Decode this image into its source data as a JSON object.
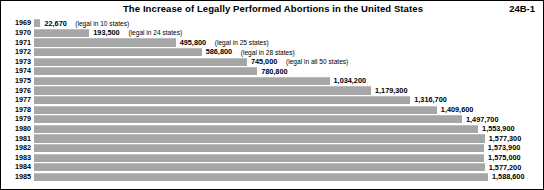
{
  "header": {
    "title": "The Increase of Legally Performed Abortions in the United States",
    "plate_code": "24B-1"
  },
  "chart_data": {
    "type": "bar",
    "orientation": "horizontal",
    "title": "The Increase of Legally Performed Abortions in the United States",
    "xlabel": "",
    "ylabel": "",
    "grid": false,
    "legend": "none",
    "xlim": [
      0,
      1588600
    ],
    "categories": [
      "1969",
      "1970",
      "1971",
      "1972",
      "1973",
      "1974",
      "1975",
      "1976",
      "1977",
      "1978",
      "1979",
      "1980",
      "1981",
      "1982",
      "1983",
      "1984",
      "1985"
    ],
    "values": [
      22670,
      193500,
      495800,
      586800,
      745000,
      780800,
      1034200,
      1179300,
      1316700,
      1409600,
      1497700,
      1553900,
      1577300,
      1573900,
      1575000,
      1577200,
      1588600
    ],
    "value_labels": [
      "22,670",
      "193,500",
      "495,800",
      "586,800",
      "745,000",
      "780,800",
      "1,034,200",
      "1,179,300",
      "1,316,700",
      "1,409,600",
      "1,497,700",
      "1,553,900",
      "1,577,300",
      "1,573,900",
      "1,575,000",
      "1,577,200",
      "1,588,600"
    ],
    "annotations": [
      "(legal in 10 states)",
      "(legal in 24 states)",
      "(legal in 25 states)",
      "(legal in 28 states)",
      "(legal in all 50 states)",
      "",
      "",
      "",
      "",
      "",
      "",
      "",
      "",
      "",
      "",
      "",
      ""
    ],
    "bar_color": "#a6a6a6",
    "background_color": "#ffffff",
    "text_color": "#000000"
  }
}
